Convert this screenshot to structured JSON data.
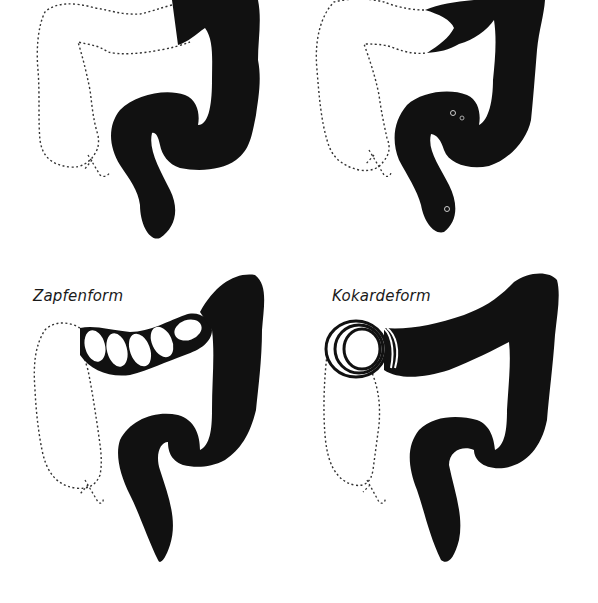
{
  "figure": {
    "panels": [
      {
        "id": "top-left",
        "label": "",
        "feature": "filled descending/sigmoid colon, transverse cut-off"
      },
      {
        "id": "top-right",
        "label": "",
        "feature": "beak-shaped tapered stop in transverse colon"
      },
      {
        "id": "bottom-left",
        "label": "Zapfenform",
        "feature": "cone/plug-shaped segmented transverse colon"
      },
      {
        "id": "bottom-right",
        "label": "Kokardeform",
        "feature": "cockade / concentric rings at hepatic flexure"
      }
    ]
  },
  "colors": {
    "background": "#ffffff",
    "fill": "#111111",
    "dotted_outline": "#333333"
  }
}
